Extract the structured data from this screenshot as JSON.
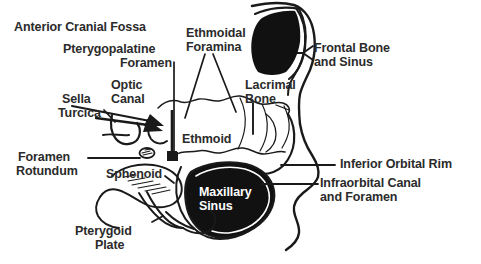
{
  "figure": {
    "kind": "anatomical-diagram",
    "background_color": "#ffffff",
    "ink_color": "#1a1a1a",
    "text_color": "#2b2b2b",
    "fill_color": "#111111",
    "reverse_text_color": "#ffffff"
  },
  "labels": {
    "anterior_cranial_fossa": "Anterior Cranial Fossa",
    "pterygopalatine_foramen_l1": "Pterygopalatine",
    "pterygopalatine_foramen_l2": "Foramen",
    "optic_canal_l1": "Optic",
    "optic_canal_l2": "Canal",
    "sella_turcica_l1": "Sella",
    "sella_turcica_l2": "Turcica",
    "foramen_rotundum_l1": "Foramen",
    "foramen_rotundum_l2": "Rotundum",
    "pterygoid_plate_l1": "Pterygoid",
    "pterygoid_plate_l2": "Plate",
    "sphenoid": "Sphenoid",
    "ethmoid": "Ethmoid",
    "ethmoidal_foramina_l1": "Ethmoidal",
    "ethmoidal_foramina_l2": "Foramina",
    "lacrimal_bone_l1": "Lacrimal",
    "lacrimal_bone_l2": "Bone",
    "frontal_bone_and_sinus_l1": "Frontal Bone",
    "frontal_bone_and_sinus_l2": "and Sinus",
    "inferior_orbital_rim": "Inferior Orbital Rim",
    "infraorbital_l1": "Infraorbital Canal",
    "infraorbital_l2": "and Foramen",
    "maxillary_sinus_l1": "Maxillary",
    "maxillary_sinus_l2": "Sinus"
  }
}
